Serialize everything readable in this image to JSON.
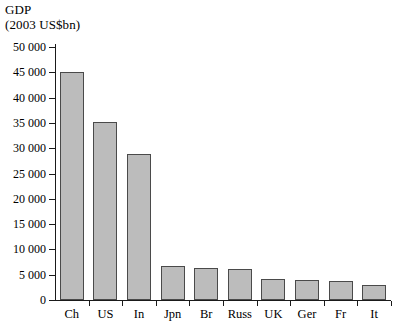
{
  "title": {
    "line1": "GDP",
    "line2": "(2003 US$bn)"
  },
  "colors": {
    "bar_fill": "#bcbcbc",
    "bar_border": "#4a4a4a",
    "axis": "#1a1a1a",
    "background": "#ffffff",
    "text": "#000000"
  },
  "axis": {
    "y_tick_labels": [
      "0",
      "5 000",
      "10 000",
      "15 000",
      "20 000",
      "25 000",
      "30 000",
      "35 000",
      "40 000",
      "45 000",
      "50 000"
    ],
    "y_tick_values": [
      0,
      5000,
      10000,
      15000,
      20000,
      25000,
      30000,
      35000,
      40000,
      45000,
      50000
    ]
  },
  "chart_data": {
    "type": "bar",
    "title": "GDP (2003 US$bn)",
    "xlabel": "",
    "ylabel": "GDP (2003 US$bn)",
    "categories": [
      "Ch",
      "US",
      "In",
      "Jpn",
      "Br",
      "Russ",
      "UK",
      "Ger",
      "Fr",
      "It"
    ],
    "values": [
      45000,
      35200,
      28800,
      6800,
      6400,
      6200,
      4200,
      4000,
      3700,
      2900
    ],
    "ylim": [
      0,
      50000
    ],
    "ytick_step": 5000,
    "grid": false,
    "legend": false
  }
}
